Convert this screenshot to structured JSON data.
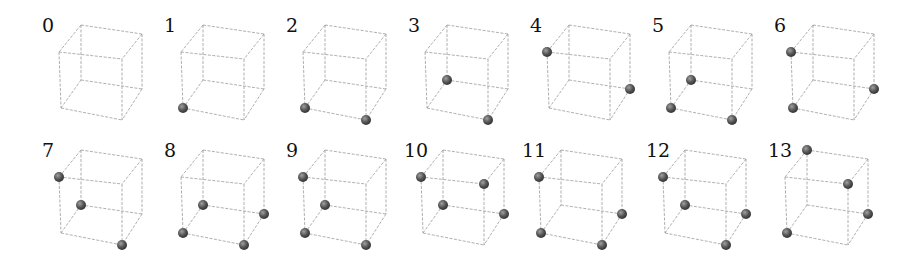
{
  "figure": {
    "colors": {
      "edge": "#9a9a9a",
      "sphere_dark": "#2e2e2e",
      "sphere_light": "#a0a0a0",
      "label": "#111111"
    },
    "vertex_names": [
      "BTL",
      "BTR",
      "FTL",
      "FTR",
      "BBL",
      "BBR",
      "FBL",
      "FBR"
    ],
    "panels": [
      {
        "label": "0",
        "x": 42,
        "y": 16,
        "vertices": []
      },
      {
        "label": "1",
        "x": 164,
        "y": 16,
        "vertices": [
          "FBL"
        ]
      },
      {
        "label": "2",
        "x": 286,
        "y": 16,
        "vertices": [
          "FBL",
          "FBR"
        ]
      },
      {
        "label": "3",
        "x": 408,
        "y": 16,
        "vertices": [
          "BBL",
          "FBR"
        ]
      },
      {
        "label": "4",
        "x": 530,
        "y": 16,
        "vertices": [
          "FTL",
          "BBR"
        ]
      },
      {
        "label": "5",
        "x": 652,
        "y": 16,
        "vertices": [
          "BBL",
          "FBL",
          "FBR"
        ]
      },
      {
        "label": "6",
        "x": 774,
        "y": 16,
        "vertices": [
          "FTL",
          "FBL",
          "BBR"
        ]
      },
      {
        "label": "7",
        "x": 42,
        "y": 141,
        "vertices": [
          "FTL",
          "BBL",
          "FBR"
        ]
      },
      {
        "label": "8",
        "x": 164,
        "y": 141,
        "vertices": [
          "BBL",
          "BBR",
          "FBL",
          "FBR"
        ]
      },
      {
        "label": "9",
        "x": 286,
        "y": 141,
        "vertices": [
          "FTL",
          "BBL",
          "FBL",
          "FBR"
        ]
      },
      {
        "label": "10",
        "x": 404,
        "y": 141,
        "vertices": [
          "FTL",
          "FTR",
          "BBL",
          "BBR"
        ]
      },
      {
        "label": "11",
        "x": 522,
        "y": 141,
        "vertices": [
          "FTL",
          "FBL",
          "FBR",
          "BBR"
        ]
      },
      {
        "label": "12",
        "x": 646,
        "y": 141,
        "vertices": [
          "FTL",
          "BBL",
          "BBR",
          "FBR"
        ]
      },
      {
        "label": "13",
        "x": 768,
        "y": 141,
        "vertices": [
          "BTL",
          "FTR",
          "BBR",
          "FBL"
        ]
      }
    ]
  }
}
